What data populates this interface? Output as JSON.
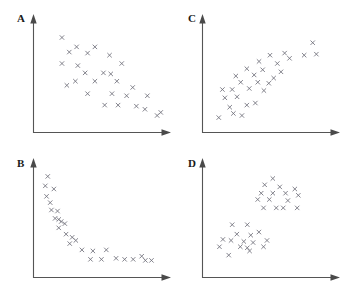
{
  "figure": {
    "width": 349,
    "height": 304,
    "background": "#ffffff",
    "marker_glyph": "x",
    "marker_color": "#6e6e78",
    "axis_color": "#555555",
    "label_color": "#1a1a1a",
    "caption": ""
  },
  "chart_data": [
    {
      "id": "panel-a",
      "type": "scatter",
      "title": "A",
      "xlabel": "",
      "ylabel": "",
      "grid": false,
      "legend": "none",
      "pattern": "negative linear correlation",
      "xlim": [
        0,
        100
      ],
      "ylim": [
        0,
        100
      ],
      "marker": "x",
      "n_points": 31,
      "points": [
        [
          18,
          87
        ],
        [
          30,
          78
        ],
        [
          24,
          73
        ],
        [
          39,
          72
        ],
        [
          45,
          78
        ],
        [
          18,
          62
        ],
        [
          31,
          60
        ],
        [
          57,
          70
        ],
        [
          37,
          53
        ],
        [
          67,
          62
        ],
        [
          52,
          53
        ],
        [
          58,
          52
        ],
        [
          29,
          45
        ],
        [
          45,
          45
        ],
        [
          22,
          41
        ],
        [
          39,
          33
        ],
        [
          63,
          45
        ],
        [
          76,
          39
        ],
        [
          59,
          33
        ],
        [
          71,
          31
        ],
        [
          88,
          31
        ],
        [
          53,
          22
        ],
        [
          64,
          22
        ],
        [
          79,
          21
        ],
        [
          86,
          18
        ],
        [
          96,
          12
        ],
        [
          99,
          15
        ]
      ]
    },
    {
      "id": "panel-b",
      "type": "scatter",
      "title": "B",
      "xlabel": "",
      "ylabel": "",
      "grid": false,
      "legend": "none",
      "pattern": "negative nonlinear decay (hyperbolic)",
      "xlim": [
        0,
        100
      ],
      "ylim": [
        0,
        100
      ],
      "marker": "x",
      "n_points": 32,
      "points": [
        [
          8,
          92
        ],
        [
          6,
          83
        ],
        [
          13,
          80
        ],
        [
          7,
          73
        ],
        [
          10,
          67
        ],
        [
          11,
          60
        ],
        [
          16,
          59
        ],
        [
          14,
          52
        ],
        [
          17,
          51
        ],
        [
          19,
          49
        ],
        [
          22,
          47
        ],
        [
          17,
          43
        ],
        [
          23,
          37
        ],
        [
          28,
          34
        ],
        [
          31,
          31
        ],
        [
          26,
          28
        ],
        [
          36,
          22
        ],
        [
          45,
          21
        ],
        [
          56,
          22
        ],
        [
          43,
          13
        ],
        [
          52,
          13
        ],
        [
          64,
          14
        ],
        [
          71,
          13
        ],
        [
          78,
          13
        ],
        [
          85,
          16
        ],
        [
          88,
          12
        ],
        [
          93,
          12
        ]
      ]
    },
    {
      "id": "panel-c",
      "type": "scatter",
      "title": "C",
      "xlabel": "",
      "ylabel": "",
      "grid": false,
      "legend": "none",
      "pattern": "positive linear correlation",
      "xlim": [
        0,
        100
      ],
      "ylim": [
        0,
        100
      ],
      "marker": "x",
      "n_points": 30,
      "points": [
        [
          8,
          10
        ],
        [
          20,
          14
        ],
        [
          27,
          12
        ],
        [
          17,
          20
        ],
        [
          31,
          22
        ],
        [
          13,
          29
        ],
        [
          23,
          30
        ],
        [
          38,
          24
        ],
        [
          11,
          37
        ],
        [
          19,
          37
        ],
        [
          33,
          38
        ],
        [
          45,
          36
        ],
        [
          26,
          44
        ],
        [
          40,
          44
        ],
        [
          49,
          43
        ],
        [
          22,
          50
        ],
        [
          37,
          51
        ],
        [
          53,
          48
        ],
        [
          31,
          57
        ],
        [
          44,
          56
        ],
        [
          59,
          54
        ],
        [
          41,
          64
        ],
        [
          56,
          62
        ],
        [
          50,
          70
        ],
        [
          66,
          67
        ],
        [
          62,
          72
        ],
        [
          78,
          70
        ],
        [
          88,
          71
        ],
        [
          85,
          82
        ]
      ]
    },
    {
      "id": "panel-d",
      "type": "scatter",
      "title": "D",
      "xlabel": "",
      "ylabel": "",
      "grid": false,
      "legend": "none",
      "pattern": "two distinct clusters",
      "xlim": [
        0,
        100
      ],
      "ylim": [
        0,
        100
      ],
      "marker": "x",
      "clusters": [
        {
          "name": "upper-right cluster",
          "n_points": 15,
          "points": [
            [
              55,
              90
            ],
            [
              48,
              84
            ],
            [
              61,
              82
            ],
            [
              74,
              80
            ],
            [
              45,
              76
            ],
            [
              55,
              76
            ],
            [
              66,
              76
            ],
            [
              77,
              74
            ],
            [
              42,
              70
            ],
            [
              52,
              70
            ],
            [
              68,
              69
            ],
            [
              47,
              62
            ],
            [
              58,
              62
            ],
            [
              64,
              62
            ],
            [
              76,
              62
            ]
          ]
        },
        {
          "name": "lower-left cluster",
          "n_points": 17,
          "points": [
            [
              20,
              46
            ],
            [
              33,
              46
            ],
            [
              43,
              39
            ],
            [
              24,
              37
            ],
            [
              36,
              36
            ],
            [
              12,
              32
            ],
            [
              19,
              31
            ],
            [
              30,
              30
            ],
            [
              38,
              29
            ],
            [
              50,
              31
            ],
            [
              9,
              25
            ],
            [
              27,
              25
            ],
            [
              33,
              24
            ],
            [
              35,
              21
            ],
            [
              47,
              25
            ],
            [
              17,
              17
            ]
          ]
        }
      ]
    }
  ],
  "panels": {
    "a": {
      "label": "A"
    },
    "b": {
      "label": "B"
    },
    "c": {
      "label": "C"
    },
    "d": {
      "label": "D"
    }
  }
}
